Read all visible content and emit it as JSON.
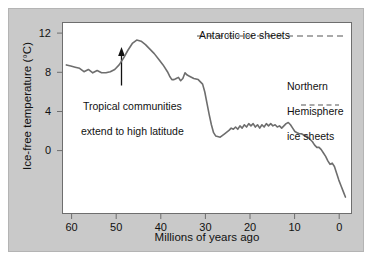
{
  "chart_data": {
    "type": "line",
    "title": "",
    "xlabel": "Millions of years ago",
    "ylabel": "Ice-free temperature (°C)",
    "xlim": [
      65,
      -1
    ],
    "ylim": [
      -4,
      13
    ],
    "x_ticks": [
      60,
      50,
      40,
      30,
      20,
      10,
      0
    ],
    "y_ticks": [
      12,
      8,
      4,
      0
    ],
    "x_tick_labels": [
      "60",
      "50",
      "40",
      "30",
      "20",
      "10",
      "0"
    ],
    "y_tick_labels": [
      "12",
      "8",
      "4",
      "0"
    ],
    "grid": false,
    "legend": "none",
    "axis_direction": "x reversed (past on left, present on right)",
    "series": [
      {
        "name": "Ice-free temperature",
        "color": "#6e6e6e",
        "x": [
          64.0,
          63.0,
          62.0,
          61.0,
          60.0,
          59.0,
          58.0,
          57.0,
          56.0,
          55.0,
          54.0,
          53.0,
          52.0,
          51.0,
          50.0,
          49.0,
          48.0,
          47.0,
          46.0,
          45.0,
          44.0,
          43.0,
          42.0,
          41.0,
          40.5,
          40.0,
          39.5,
          39.0,
          38.5,
          38.0,
          37.5,
          37.0,
          36.5,
          36.0,
          35.0,
          34.0,
          33.5,
          33.0,
          32.5,
          32.0,
          31.5,
          31.0,
          30.5,
          30.0,
          29.0,
          28.0,
          27.0,
          26.5,
          26.0,
          25.5,
          25.0,
          24.5,
          24.0,
          23.5,
          23.0,
          22.5,
          22.0,
          21.5,
          21.0,
          20.5,
          20.0,
          19.5,
          19.0,
          18.5,
          18.0,
          17.5,
          17.0,
          16.5,
          16.0,
          15.5,
          15.0,
          14.5,
          14.0,
          13.5,
          13.0,
          12.5,
          12.0,
          11.5,
          11.0,
          10.5,
          10.0,
          9.5,
          9.0,
          8.5,
          8.0,
          7.5,
          7.0,
          6.5,
          6.0,
          5.5,
          5.0,
          4.5,
          4.0,
          3.5,
          3.0,
          2.5,
          2.0,
          1.5,
          1.0,
          0.5
        ],
        "y": [
          9.2,
          9.1,
          9.0,
          8.9,
          8.6,
          8.8,
          8.5,
          8.7,
          8.5,
          8.5,
          8.6,
          8.8,
          9.2,
          9.8,
          10.5,
          11.1,
          11.4,
          11.3,
          11.0,
          10.6,
          10.2,
          9.7,
          9.2,
          8.6,
          8.2,
          7.9,
          7.9,
          8.0,
          8.1,
          7.8,
          8.0,
          8.5,
          8.3,
          8.2,
          8.0,
          7.9,
          7.7,
          7.5,
          6.8,
          5.8,
          4.8,
          3.9,
          3.2,
          2.9,
          2.8,
          3.1,
          3.4,
          3.6,
          3.5,
          3.7,
          3.5,
          3.8,
          3.6,
          3.9,
          3.7,
          4.0,
          3.8,
          4.0,
          3.7,
          3.9,
          3.6,
          3.9,
          3.7,
          4.0,
          3.8,
          4.0,
          3.8,
          3.9,
          3.7,
          3.8,
          3.6,
          3.8,
          4.0,
          4.1,
          3.9,
          3.6,
          3.3,
          3.2,
          3.1,
          3.1,
          3.0,
          2.9,
          2.8,
          2.6,
          2.4,
          2.1,
          1.9,
          1.9,
          1.7,
          1.4,
          1.1,
          0.7,
          0.4,
          0.5,
          0.2,
          -0.4,
          -1.0,
          -1.5,
          -2.0,
          -2.5
        ]
      }
    ],
    "annotations": [
      {
        "name": "tropical-communities",
        "text": "Tropical communities\nextend to high latitude",
        "x": 49,
        "y": 9.8,
        "marker": "upward-arrow"
      },
      {
        "name": "antarctic-ice-sheets",
        "text": "Antarctic ice sheets",
        "indicator": "dashed-line",
        "indicator_span_x": [
          35,
          0
        ],
        "indicator_y": 12.3
      },
      {
        "name": "northern-hemisphere-ice-sheets",
        "text": "Northern\nHemisphere\nice sheets",
        "indicator": "dashed-line",
        "indicator_span_x": [
          9,
          2
        ],
        "indicator_y": 5.2
      }
    ]
  },
  "axes": {
    "x_label": "Millions of years ago",
    "y_label": "Ice-free temperature (°C)",
    "x_tick_labels": [
      "60",
      "50",
      "40",
      "30",
      "20",
      "10",
      "0"
    ],
    "y_tick_labels": [
      "12",
      "8",
      "4",
      "0"
    ]
  },
  "annotations": {
    "tropical_line1": "Tropical communities",
    "tropical_line2": "extend to high latitude",
    "antarctic": "Antarctic ice sheets",
    "northern_line1": "Northern",
    "northern_line2": "Hemisphere",
    "northern_line3": "ice sheets"
  },
  "colors": {
    "background": "#c9c9c9",
    "plot_background": "#ffffff",
    "curve": "#6e6e6e",
    "axis": "#6e6e6e",
    "text": "#111111"
  }
}
